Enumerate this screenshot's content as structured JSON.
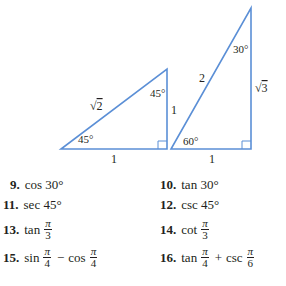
{
  "figure": {
    "line_color": "#5b8fd6",
    "triangle_45": {
      "hypotenuse": "√2",
      "hyp_radicand": "2",
      "vertical_leg": "1",
      "base": "1",
      "top_angle": "45°",
      "bottom_angle": "45°"
    },
    "triangle_30_60": {
      "hypotenuse": "2",
      "vertical_leg_radicand": "3",
      "base": "1",
      "top_angle": "30°",
      "bottom_angle": "60°"
    }
  },
  "exercises": [
    {
      "number": "9.",
      "expr": "cos 30°"
    },
    {
      "number": "10.",
      "expr": "tan 30°"
    },
    {
      "number": "11.",
      "expr": "sec 45°"
    },
    {
      "number": "12.",
      "expr": "csc 45°"
    },
    {
      "number": "13.",
      "fn": "tan",
      "num": "π",
      "den": "3"
    },
    {
      "number": "14.",
      "fn": "cot",
      "num": "π",
      "den": "3"
    },
    {
      "number": "15.",
      "fn1": "sin",
      "num1": "π",
      "den1": "4",
      "op": "−",
      "fn2": "cos",
      "num2": "π",
      "den2": "4"
    },
    {
      "number": "16.",
      "fn1": "tan",
      "num1": "π",
      "den1": "4",
      "op": "+",
      "fn2": "csc",
      "num2": "π",
      "den2": "6"
    }
  ]
}
